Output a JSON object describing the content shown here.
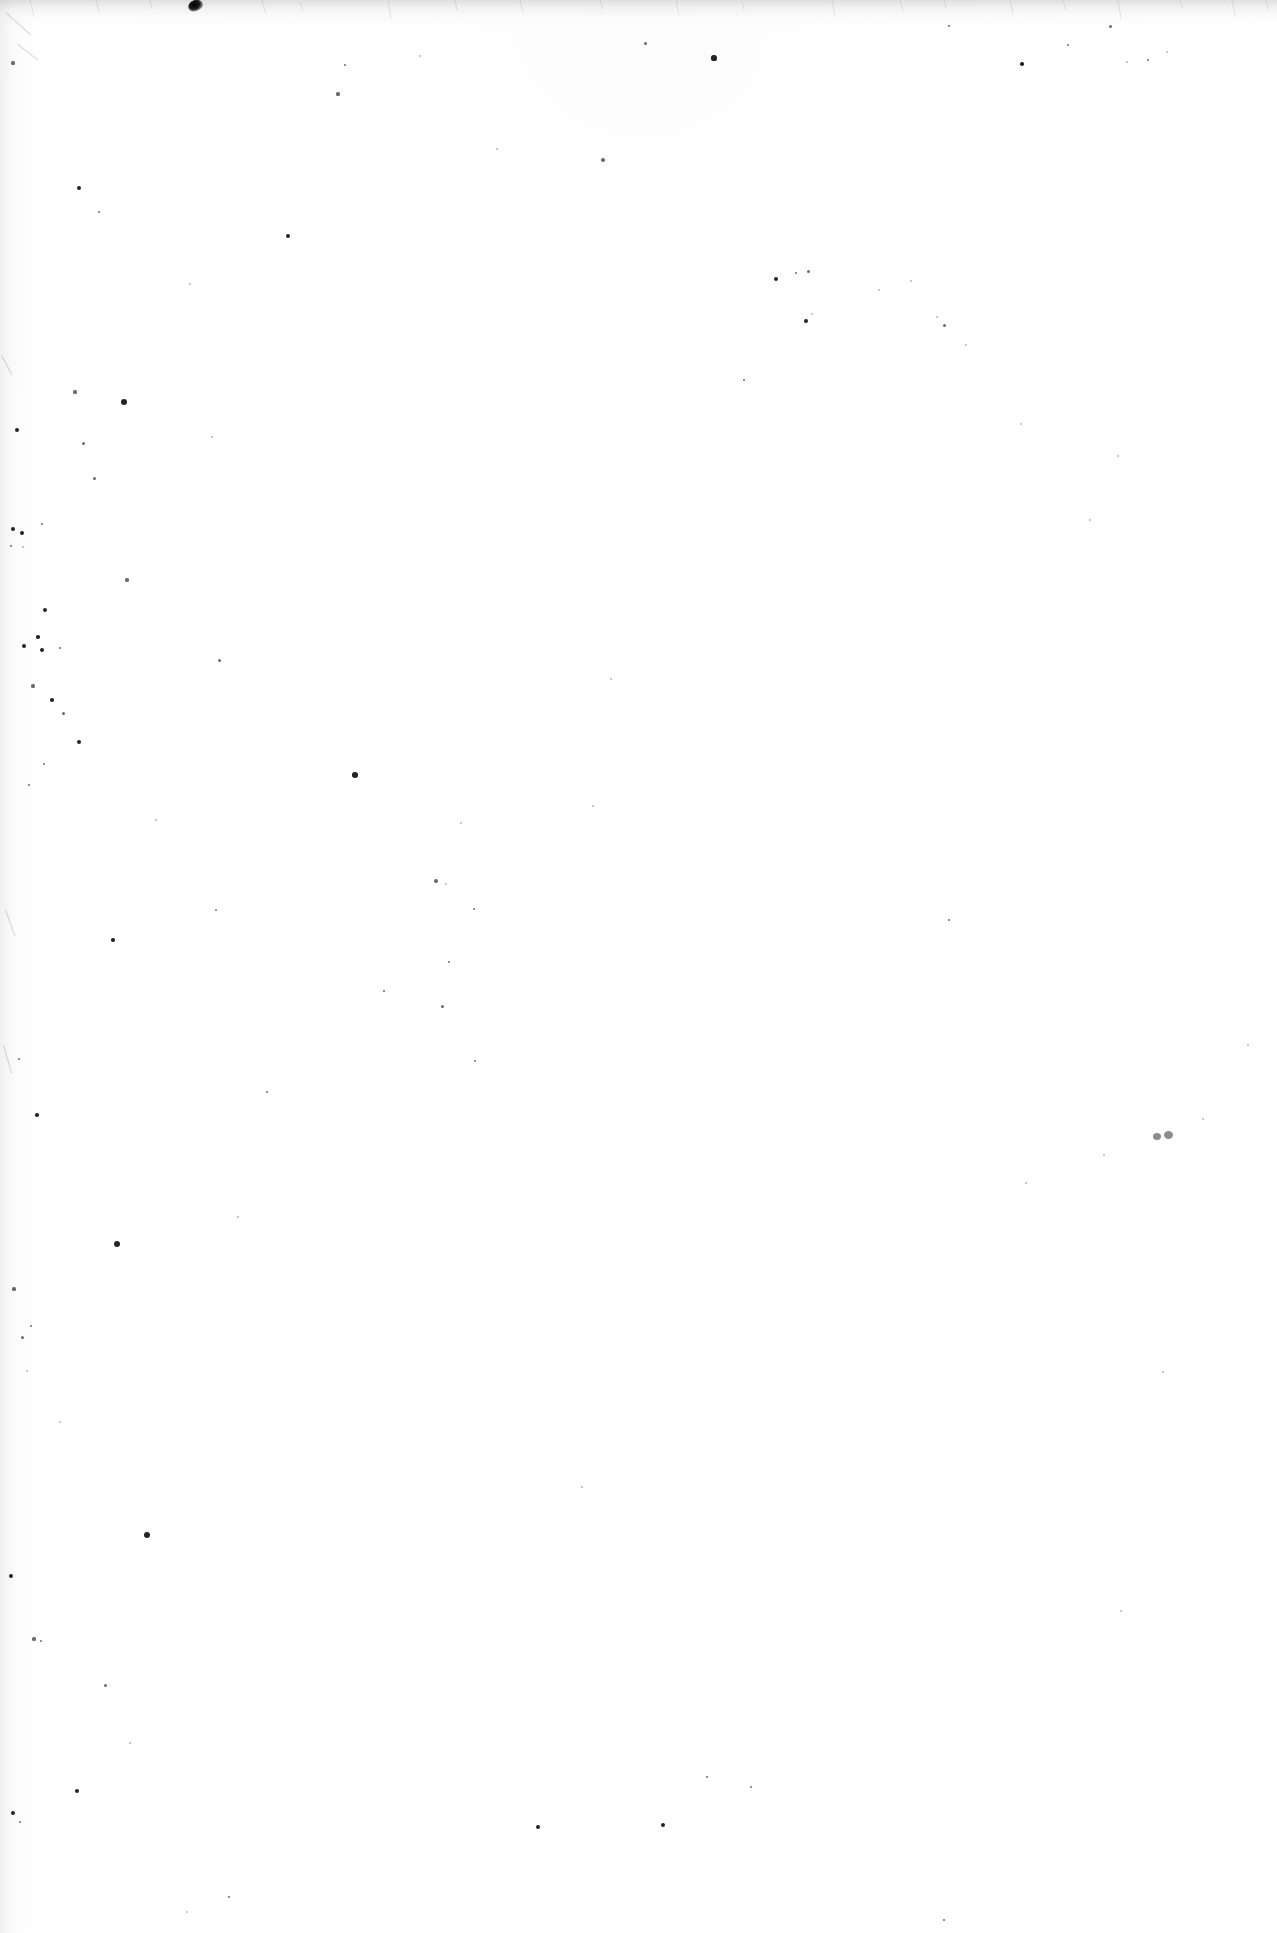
{
  "page": {
    "kind": "scanned-page",
    "content_type": "blank",
    "width": 1277,
    "height": 1933,
    "text_content": "",
    "visible_text_items": [],
    "description": "Blank scanned page of white paper with scattered dust specks; no printed text, headings, figures or page number visible.",
    "orientation": "portrait"
  },
  "colors": {
    "paper": "#ffffff",
    "paper_tint": "#fdfdfd",
    "speck_dark": "#111111",
    "speck_grey": "#8d8d8d",
    "edge_shadow": "#969696"
  },
  "artifacts": {
    "top_edge_shadow": {
      "name": "top-edge-scan-shadow",
      "x": 0,
      "y": 0,
      "width": 1277,
      "height": 26
    },
    "left_gutter_shadow": {
      "name": "left-gutter-scan-shadow",
      "x": 0,
      "y": 0,
      "width": 34,
      "height": 1933
    },
    "top_blot": {
      "name": "top-edge-ink-blot",
      "x": 188,
      "y": 0,
      "width": 15,
      "height": 11
    },
    "grey_double_speck": {
      "name": "grey-double-speck",
      "x": 1153,
      "y": 1131,
      "width": 23,
      "height": 9
    },
    "specks": [
      {
        "x": 13,
        "y": 63,
        "r": 1.6
      },
      {
        "x": 79,
        "y": 188,
        "r": 2.0
      },
      {
        "x": 99,
        "y": 212,
        "r": 1.4
      },
      {
        "x": 190,
        "y": 284,
        "r": 1.2
      },
      {
        "x": 288,
        "y": 236,
        "r": 2.2
      },
      {
        "x": 338,
        "y": 94,
        "r": 1.6
      },
      {
        "x": 345,
        "y": 65,
        "r": 1.3
      },
      {
        "x": 420,
        "y": 56,
        "r": 1.2
      },
      {
        "x": 497,
        "y": 149,
        "r": 1.1
      },
      {
        "x": 603,
        "y": 160,
        "r": 1.7
      },
      {
        "x": 645,
        "y": 43,
        "r": 1.5
      },
      {
        "x": 714,
        "y": 58,
        "r": 2.6
      },
      {
        "x": 744,
        "y": 380,
        "r": 1.3
      },
      {
        "x": 776,
        "y": 279,
        "r": 2.3
      },
      {
        "x": 796,
        "y": 273,
        "r": 1.4
      },
      {
        "x": 808,
        "y": 271,
        "r": 1.5
      },
      {
        "x": 806,
        "y": 321,
        "r": 1.9
      },
      {
        "x": 812,
        "y": 314,
        "r": 1.2
      },
      {
        "x": 879,
        "y": 290,
        "r": 1.1
      },
      {
        "x": 911,
        "y": 281,
        "r": 1.2
      },
      {
        "x": 944,
        "y": 325,
        "r": 1.5
      },
      {
        "x": 949,
        "y": 26,
        "r": 1.4
      },
      {
        "x": 966,
        "y": 345,
        "r": 1.2
      },
      {
        "x": 1022,
        "y": 64,
        "r": 1.8
      },
      {
        "x": 1068,
        "y": 45,
        "r": 1.3
      },
      {
        "x": 1110,
        "y": 26,
        "r": 1.5
      },
      {
        "x": 1127,
        "y": 62,
        "r": 1.2
      },
      {
        "x": 1148,
        "y": 60,
        "r": 1.4
      },
      {
        "x": 1167,
        "y": 52,
        "r": 1.1
      },
      {
        "x": 17,
        "y": 430,
        "r": 2.4
      },
      {
        "x": 75,
        "y": 392,
        "r": 1.6
      },
      {
        "x": 83,
        "y": 443,
        "r": 1.5
      },
      {
        "x": 124,
        "y": 402,
        "r": 3.0
      },
      {
        "x": 94,
        "y": 478,
        "r": 1.5
      },
      {
        "x": 212,
        "y": 437,
        "r": 1.2
      },
      {
        "x": 13,
        "y": 529,
        "r": 2.0
      },
      {
        "x": 22,
        "y": 533,
        "r": 1.9
      },
      {
        "x": 42,
        "y": 524,
        "r": 1.3
      },
      {
        "x": 11,
        "y": 546,
        "r": 1.3
      },
      {
        "x": 23,
        "y": 547,
        "r": 1.2
      },
      {
        "x": 45,
        "y": 610,
        "r": 2.0
      },
      {
        "x": 38,
        "y": 637,
        "r": 1.8
      },
      {
        "x": 24,
        "y": 646,
        "r": 2.1
      },
      {
        "x": 42,
        "y": 650,
        "r": 2.4
      },
      {
        "x": 60,
        "y": 648,
        "r": 1.4
      },
      {
        "x": 33,
        "y": 686,
        "r": 1.6
      },
      {
        "x": 52,
        "y": 700,
        "r": 1.8
      },
      {
        "x": 63,
        "y": 713,
        "r": 1.5
      },
      {
        "x": 79,
        "y": 742,
        "r": 2.2
      },
      {
        "x": 44,
        "y": 764,
        "r": 1.4
      },
      {
        "x": 29,
        "y": 785,
        "r": 1.3
      },
      {
        "x": 113,
        "y": 940,
        "r": 1.8
      },
      {
        "x": 127,
        "y": 580,
        "r": 1.6
      },
      {
        "x": 156,
        "y": 820,
        "r": 1.2
      },
      {
        "x": 219,
        "y": 660,
        "r": 1.5
      },
      {
        "x": 216,
        "y": 910,
        "r": 1.4
      },
      {
        "x": 267,
        "y": 1092,
        "r": 1.3
      },
      {
        "x": 355,
        "y": 775,
        "r": 2.8
      },
      {
        "x": 384,
        "y": 991,
        "r": 1.3
      },
      {
        "x": 436,
        "y": 881,
        "r": 1.7
      },
      {
        "x": 442,
        "y": 1006,
        "r": 1.5
      },
      {
        "x": 449,
        "y": 962,
        "r": 1.3
      },
      {
        "x": 461,
        "y": 823,
        "r": 1.2
      },
      {
        "x": 474,
        "y": 909,
        "r": 1.3
      },
      {
        "x": 593,
        "y": 806,
        "r": 1.2
      },
      {
        "x": 611,
        "y": 679,
        "r": 1.2
      },
      {
        "x": 19,
        "y": 1059,
        "r": 1.3
      },
      {
        "x": 37,
        "y": 1115,
        "r": 1.8
      },
      {
        "x": 117,
        "y": 1244,
        "r": 3.1
      },
      {
        "x": 238,
        "y": 1217,
        "r": 1.2
      },
      {
        "x": 14,
        "y": 1289,
        "r": 1.6
      },
      {
        "x": 22,
        "y": 1337,
        "r": 1.5
      },
      {
        "x": 31,
        "y": 1326,
        "r": 1.3
      },
      {
        "x": 27,
        "y": 1371,
        "r": 1.2
      },
      {
        "x": 60,
        "y": 1422,
        "r": 1.2
      },
      {
        "x": 147,
        "y": 1535,
        "r": 3.0
      },
      {
        "x": 11,
        "y": 1576,
        "r": 2.4
      },
      {
        "x": 34,
        "y": 1639,
        "r": 1.6
      },
      {
        "x": 41,
        "y": 1641,
        "r": 1.3
      },
      {
        "x": 105,
        "y": 1685,
        "r": 1.5
      },
      {
        "x": 77,
        "y": 1791,
        "r": 2.2
      },
      {
        "x": 13,
        "y": 1813,
        "r": 1.9
      },
      {
        "x": 20,
        "y": 1822,
        "r": 1.4
      },
      {
        "x": 130,
        "y": 1743,
        "r": 1.2
      },
      {
        "x": 187,
        "y": 1912,
        "r": 1.2
      },
      {
        "x": 229,
        "y": 1897,
        "r": 1.3
      },
      {
        "x": 446,
        "y": 884,
        "r": 1.2
      },
      {
        "x": 475,
        "y": 1061,
        "r": 1.4
      },
      {
        "x": 538,
        "y": 1827,
        "r": 2.3
      },
      {
        "x": 582,
        "y": 1487,
        "r": 1.2
      },
      {
        "x": 663,
        "y": 1825,
        "r": 2.2
      },
      {
        "x": 707,
        "y": 1777,
        "r": 1.3
      },
      {
        "x": 751,
        "y": 1787,
        "r": 1.4
      },
      {
        "x": 944,
        "y": 1920,
        "r": 1.3
      },
      {
        "x": 1026,
        "y": 1183,
        "r": 1.2
      },
      {
        "x": 1104,
        "y": 1155,
        "r": 1.2
      },
      {
        "x": 1121,
        "y": 1611,
        "r": 1.2
      },
      {
        "x": 1163,
        "y": 1372,
        "r": 1.1
      },
      {
        "x": 1203,
        "y": 1119,
        "r": 1.2
      },
      {
        "x": 1248,
        "y": 1045,
        "r": 1.1
      },
      {
        "x": 1021,
        "y": 424,
        "r": 1.2
      },
      {
        "x": 1090,
        "y": 520,
        "r": 1.2
      },
      {
        "x": 1118,
        "y": 456,
        "r": 1.1
      },
      {
        "x": 937,
        "y": 317,
        "r": 1.2
      },
      {
        "x": 949,
        "y": 920,
        "r": 1.3
      }
    ],
    "hairlines": [
      {
        "x": 6,
        "y": 12,
        "length": 34,
        "angle": 42,
        "width": 1.2
      },
      {
        "x": 18,
        "y": 44,
        "length": 26,
        "angle": 38,
        "width": 1.0
      },
      {
        "x": 2,
        "y": 355,
        "length": 22,
        "angle": 62,
        "width": 1.2
      },
      {
        "x": 6,
        "y": 910,
        "length": 28,
        "angle": 70,
        "width": 1.0
      },
      {
        "x": 4,
        "y": 1045,
        "length": 30,
        "angle": 74,
        "width": 1.0
      }
    ]
  }
}
